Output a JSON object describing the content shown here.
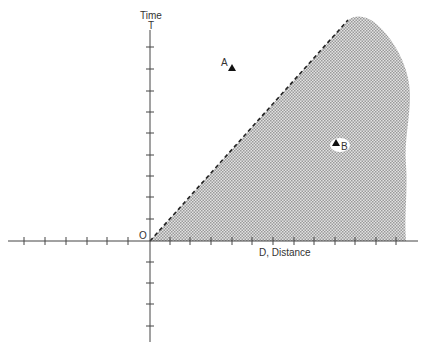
{
  "diagram": {
    "type": "space-time diagram",
    "y_axis": {
      "label": "Time",
      "end_label": "T"
    },
    "x_axis": {
      "label": "D, Distance"
    },
    "origin_label": "O",
    "points": [
      {
        "label": "A",
        "region": "outside shaded region"
      },
      {
        "label": "B",
        "region": "inside shaded region"
      }
    ],
    "boundary": {
      "style": "dashed diagonal line from origin"
    },
    "colors": {
      "ink": "#333333",
      "shade": "#bdbdbd",
      "background": "#ffffff"
    }
  }
}
